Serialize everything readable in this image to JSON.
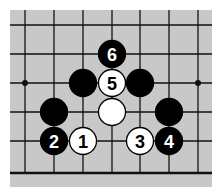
{
  "board": {
    "background": "#c8c8c8",
    "line_color": "#111111",
    "columns_x": [
      25,
      54,
      83,
      112,
      140,
      169,
      198
    ],
    "rows_y": [
      25,
      54,
      83,
      112,
      141
    ],
    "bottom_edge_y": 173,
    "star_points": [
      [
        25,
        83
      ],
      [
        198,
        83
      ]
    ]
  },
  "stones": [
    {
      "color": "black",
      "x": 112,
      "y": 54,
      "label": "6"
    },
    {
      "color": "black",
      "x": 83,
      "y": 83,
      "label": ""
    },
    {
      "color": "white",
      "x": 112,
      "y": 83,
      "label": "5"
    },
    {
      "color": "black",
      "x": 140,
      "y": 83,
      "label": ""
    },
    {
      "color": "black",
      "x": 54,
      "y": 112,
      "label": ""
    },
    {
      "color": "white",
      "x": 112,
      "y": 112,
      "label": ""
    },
    {
      "color": "black",
      "x": 169,
      "y": 112,
      "label": ""
    },
    {
      "color": "black",
      "x": 54,
      "y": 141,
      "label": "2"
    },
    {
      "color": "white",
      "x": 83,
      "y": 141,
      "label": "1"
    },
    {
      "color": "white",
      "x": 140,
      "y": 141,
      "label": "3"
    },
    {
      "color": "black",
      "x": 169,
      "y": 141,
      "label": "4"
    }
  ]
}
